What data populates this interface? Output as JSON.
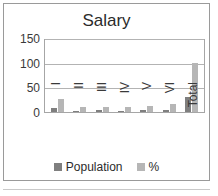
{
  "chart_data": {
    "type": "bar",
    "title": "Salary",
    "xlabel": "",
    "ylabel": "",
    "ylim": [
      0,
      150
    ],
    "yticks": [
      0,
      50,
      100,
      150
    ],
    "grid": true,
    "legend_position": "bottom",
    "categories": [
      "I",
      "II",
      "III",
      "IV",
      "V",
      "VI",
      "Total"
    ],
    "series": [
      {
        "name": "Population",
        "color": "#7f7f7f",
        "values": [
          9,
          3,
          4,
          3,
          4,
          5,
          31
        ]
      },
      {
        "name": "%",
        "color": "#b6b6b6",
        "values": [
          27,
          10,
          11,
          10,
          13,
          17,
          100
        ]
      }
    ]
  },
  "chart": {
    "title": "Salary",
    "y_ticks": [
      "150",
      "100",
      "50",
      "0"
    ],
    "category_labels": [
      "I",
      "II",
      "III",
      "IV",
      "V",
      "VI",
      "Total"
    ],
    "legend": [
      {
        "label": "Population",
        "color": "#7f7f7f"
      },
      {
        "label": "%",
        "color": "#b6b6b6"
      }
    ]
  }
}
